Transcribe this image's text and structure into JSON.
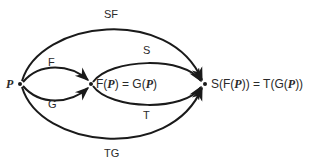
{
  "diagram": {
    "nodes": [
      {
        "id": "P",
        "label": "P"
      },
      {
        "id": "FP",
        "label_parts": [
          "F(",
          "P",
          ") = G(",
          "P",
          ")"
        ]
      },
      {
        "id": "SFP",
        "label_parts": [
          "S(F(",
          "P",
          ")) = T(G(",
          "P",
          "))"
        ]
      }
    ],
    "edges": [
      {
        "id": "F",
        "label": "F",
        "from": "P",
        "to": "FP"
      },
      {
        "id": "G",
        "label": "G",
        "from": "P",
        "to": "FP"
      },
      {
        "id": "S",
        "label": "S",
        "from": "FP",
        "to": "SFP"
      },
      {
        "id": "T",
        "label": "T",
        "from": "FP",
        "to": "SFP"
      },
      {
        "id": "SF",
        "label": "SF",
        "from": "P",
        "to": "SFP"
      },
      {
        "id": "TG",
        "label": "TG",
        "from": "P",
        "to": "SFP"
      }
    ],
    "colors": {
      "stroke": "#2a2a2a",
      "text": "#2a2a2a",
      "background": "#ffffff"
    }
  }
}
